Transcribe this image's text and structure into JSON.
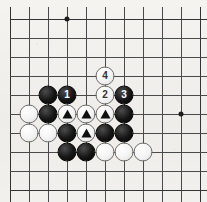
{
  "diagram": {
    "type": "go-board-problem",
    "board": {
      "columns": 11,
      "rows": 10,
      "line_color": "#4a4a4a",
      "board_color": "#f2f1ee",
      "origin_x": 10,
      "origin_y": 19,
      "spacing": 19
    },
    "star_points": [
      {
        "name": "star-point-top",
        "col": 3,
        "row": 0
      },
      {
        "name": "star-point-right",
        "col": 9,
        "row": 5
      }
    ],
    "stones": [
      {
        "name": "black-stone",
        "color": "black",
        "col": 2,
        "row": 4,
        "label": "",
        "mark": ""
      },
      {
        "name": "black-stone-move-1",
        "color": "black",
        "col": 3,
        "row": 4,
        "label": "1",
        "mark": "number"
      },
      {
        "name": "white-stone-move-2",
        "color": "white",
        "col": 5,
        "row": 4,
        "label": "2",
        "mark": "number"
      },
      {
        "name": "black-stone-move-3",
        "color": "black",
        "col": 6,
        "row": 4,
        "label": "3",
        "mark": "number"
      },
      {
        "name": "white-stone-move-4",
        "color": "white",
        "col": 5,
        "row": 3,
        "label": "4",
        "mark": "number"
      },
      {
        "name": "white-stone",
        "color": "white",
        "col": 1,
        "row": 5,
        "label": "",
        "mark": ""
      },
      {
        "name": "black-stone",
        "color": "black",
        "col": 2,
        "row": 5,
        "label": "",
        "mark": ""
      },
      {
        "name": "white-stone-marked",
        "color": "white",
        "col": 3,
        "row": 5,
        "label": "",
        "mark": "triangle"
      },
      {
        "name": "white-stone-marked",
        "color": "white",
        "col": 4,
        "row": 5,
        "label": "",
        "mark": "triangle"
      },
      {
        "name": "white-stone-marked",
        "color": "white",
        "col": 5,
        "row": 5,
        "label": "",
        "mark": "triangle"
      },
      {
        "name": "black-stone",
        "color": "black",
        "col": 6,
        "row": 5,
        "label": "",
        "mark": ""
      },
      {
        "name": "white-stone",
        "color": "white",
        "col": 1,
        "row": 6,
        "label": "",
        "mark": ""
      },
      {
        "name": "white-stone",
        "color": "white",
        "col": 2,
        "row": 6,
        "label": "",
        "mark": ""
      },
      {
        "name": "black-stone",
        "color": "black",
        "col": 3,
        "row": 6,
        "label": "",
        "mark": ""
      },
      {
        "name": "white-stone-marked",
        "color": "white",
        "col": 4,
        "row": 6,
        "label": "",
        "mark": "triangle"
      },
      {
        "name": "black-stone",
        "color": "black",
        "col": 5,
        "row": 6,
        "label": "",
        "mark": ""
      },
      {
        "name": "black-stone",
        "color": "black",
        "col": 6,
        "row": 6,
        "label": "",
        "mark": ""
      },
      {
        "name": "black-stone",
        "color": "black",
        "col": 3,
        "row": 7,
        "label": "",
        "mark": ""
      },
      {
        "name": "black-stone",
        "color": "black",
        "col": 4,
        "row": 7,
        "label": "",
        "mark": ""
      },
      {
        "name": "white-stone",
        "color": "white",
        "col": 5,
        "row": 7,
        "label": "",
        "mark": ""
      },
      {
        "name": "white-stone",
        "color": "white",
        "col": 6,
        "row": 7,
        "label": "",
        "mark": ""
      },
      {
        "name": "white-stone",
        "color": "white",
        "col": 7,
        "row": 7,
        "label": "",
        "mark": ""
      }
    ]
  }
}
